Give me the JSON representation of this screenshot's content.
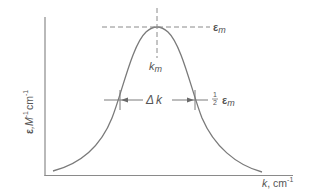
{
  "diagram": {
    "colors": {
      "background": "#ffffff",
      "line": "#7a7a7a",
      "axis": "#8a8a8a",
      "text": "#555555"
    },
    "axes": {
      "x_label_symbol": "k",
      "x_label_sep": ", cm",
      "x_label_exp": "-1",
      "y_label_symbol": "ε",
      "y_label_unit1": ",M",
      "y_label_exp1": "-1",
      "y_label_unit2": "cm",
      "y_label_exp2": "-1"
    },
    "annotations": {
      "peak_symbol": "ε",
      "peak_sub": "m",
      "peak_position_symbol": "k",
      "peak_position_sub": "m",
      "width_label_delta": "Δ",
      "width_label_k": "k",
      "half_max_frac_num": "1",
      "half_max_frac_den": "2",
      "half_max_symbol": "ε",
      "half_max_sub": "m"
    },
    "geometry": {
      "y_axis_x": 45,
      "x_axis_y": 175,
      "peak_x": 157,
      "peak_y": 27,
      "half_max_y": 100,
      "half_left_x": 120,
      "half_right_x": 195
    }
  }
}
